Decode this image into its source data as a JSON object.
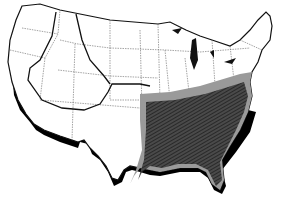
{
  "map": {
    "subject": "United States outline map",
    "regions": [
      {
        "name": "southeast-range-core",
        "fill": "#3a3a3a",
        "pattern": "diagonal-hatch"
      },
      {
        "name": "southeast-range-margin",
        "fill": "#9a9a9a"
      }
    ],
    "boundary_lines": [
      "western-range-boundary-loop",
      "central-range-boundary"
    ],
    "colors": {
      "land": "#ffffff",
      "outline": "#111111",
      "state_lines": "#555555",
      "shadow": "#000000"
    }
  }
}
